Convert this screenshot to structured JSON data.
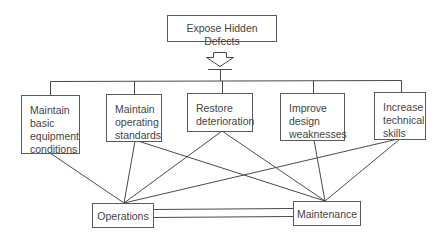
{
  "diagram": {
    "title_box": {
      "label": "Expose Hidden Defects"
    },
    "arrow": {
      "direction": "down",
      "style": "hollow"
    },
    "activities": [
      {
        "id": "a1",
        "label": "Maintain\nbasic\nequipment\nconditions"
      },
      {
        "id": "a2",
        "label": "Maintain\noperating\nstandards"
      },
      {
        "id": "a3",
        "label": "Restore\ndeterioration"
      },
      {
        "id": "a4",
        "label": "Improve\ndesign\nweaknesses"
      },
      {
        "id": "a5",
        "label": "Increase\ntechnical\nskills"
      }
    ],
    "departments": [
      {
        "id": "ops",
        "label": "Operations"
      },
      {
        "id": "maint",
        "label": "Maintenance"
      }
    ],
    "connections": [
      {
        "from": "a1",
        "to": "ops"
      },
      {
        "from": "a2",
        "to": "ops"
      },
      {
        "from": "a2",
        "to": "maint"
      },
      {
        "from": "a3",
        "to": "ops"
      },
      {
        "from": "a3",
        "to": "maint"
      },
      {
        "from": "a4",
        "to": "maint"
      },
      {
        "from": "a5",
        "to": "ops"
      },
      {
        "from": "a5",
        "to": "maint"
      },
      {
        "from": "ops",
        "to": "maint",
        "style": "double"
      }
    ],
    "colors": {
      "line": "#4a4a4a",
      "text": "#444444",
      "background": "#ffffff"
    }
  }
}
